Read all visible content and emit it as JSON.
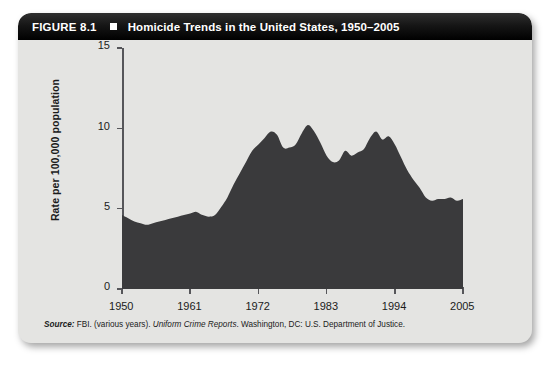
{
  "figure": {
    "number": "FIGURE 8.1",
    "bullet": "square-bullet-icon",
    "title": "Homicide Trends in the United States, 1950–2005"
  },
  "source": {
    "label": "Source:",
    "text_before": "FBI. (various years).",
    "italic_part": "Uniform Crime Reports",
    "text_after": ". Washington, DC: U.S. Department of Justice."
  },
  "colors": {
    "panel_background": "#e4e4e2",
    "title_bar": "#111111",
    "series_fill": "#3a3a3c",
    "axis": "#56565a",
    "text": "#1b1b1b"
  },
  "chart_data": {
    "type": "area",
    "title": "Homicide Trends in the United States, 1950–2005",
    "xlabel": "",
    "ylabel": "Rate per 100,000 population",
    "xlim": [
      1950,
      2005
    ],
    "ylim": [
      0,
      15
    ],
    "grid": false,
    "legend": null,
    "y_ticks": [
      0,
      5,
      10,
      15
    ],
    "x_ticks": [
      1950,
      1961,
      1972,
      1983,
      1994,
      2005
    ],
    "series": [
      {
        "name": "Homicide rate per 100,000 population",
        "x": [
          1950,
          1951,
          1952,
          1953,
          1954,
          1955,
          1956,
          1957,
          1958,
          1959,
          1960,
          1961,
          1962,
          1963,
          1964,
          1965,
          1966,
          1967,
          1968,
          1969,
          1970,
          1971,
          1972,
          1973,
          1974,
          1975,
          1976,
          1977,
          1978,
          1979,
          1980,
          1981,
          1982,
          1983,
          1984,
          1985,
          1986,
          1987,
          1988,
          1989,
          1990,
          1991,
          1992,
          1993,
          1994,
          1995,
          1996,
          1997,
          1998,
          1999,
          2000,
          2001,
          2002,
          2003,
          2004,
          2005
        ],
        "values": [
          4.6,
          4.4,
          4.2,
          4.1,
          4.0,
          4.1,
          4.2,
          4.3,
          4.4,
          4.5,
          4.6,
          4.7,
          4.8,
          4.6,
          4.5,
          4.6,
          5.1,
          5.7,
          6.5,
          7.2,
          7.9,
          8.6,
          9.0,
          9.4,
          9.8,
          9.6,
          8.8,
          8.8,
          9.0,
          9.7,
          10.2,
          9.8,
          9.1,
          8.3,
          7.9,
          8.0,
          8.6,
          8.3,
          8.5,
          8.7,
          9.4,
          9.8,
          9.3,
          9.5,
          9.0,
          8.2,
          7.4,
          6.8,
          6.3,
          5.7,
          5.5,
          5.6,
          5.6,
          5.7,
          5.5,
          5.6
        ]
      }
    ]
  }
}
